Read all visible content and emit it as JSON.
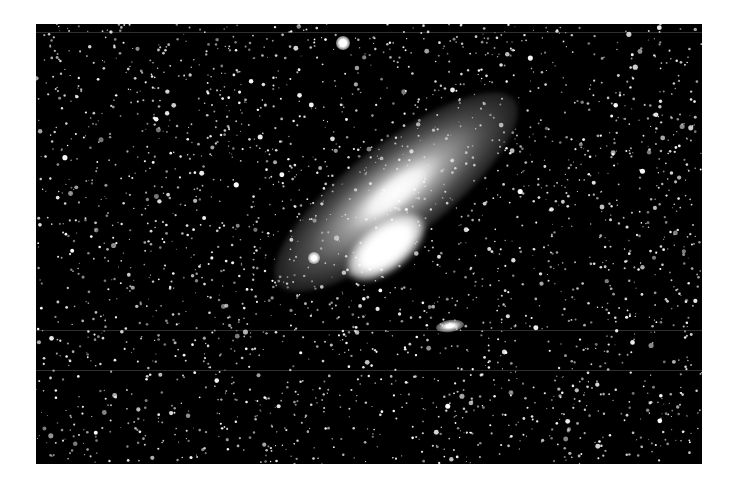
{
  "image": {
    "subject": "Andromeda galaxy star field (grayscale astrophotograph)",
    "background_color": "#000000",
    "frame_color": "#ffffff",
    "features": {
      "galaxy": "Large spiral galaxy tilted diagonally, bright core",
      "satellite_1": "Small compact companion near lower-left of core",
      "satellite_2": "Small elongated companion below-right of galaxy",
      "bright_star": "Bright star near top center"
    }
  }
}
